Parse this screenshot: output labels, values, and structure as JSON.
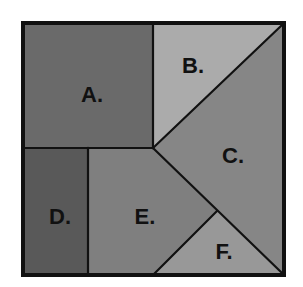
{
  "diagram": {
    "type": "square-dissection-puzzle",
    "outer_square": {
      "x": 23,
      "y": 23,
      "width": 261,
      "height": 252,
      "border_color": "#111111",
      "border_width": 4
    },
    "pieces": [
      {
        "id": "A",
        "label": "A.",
        "shape": "square",
        "fill": "#6a6a6a",
        "points": "25,25 153,25 153,148 25,148",
        "label_pos": {
          "x": 92,
          "y": 96
        }
      },
      {
        "id": "B",
        "label": "B.",
        "shape": "triangle",
        "fill": "#ababab",
        "points": "153,25 282,25 153,148",
        "label_pos": {
          "x": 193,
          "y": 67
        }
      },
      {
        "id": "C",
        "label": "C.",
        "shape": "quadrilateral",
        "fill": "#868686",
        "points": "282,25 282,273 153,148",
        "label_pos": {
          "x": 233,
          "y": 157
        }
      },
      {
        "id": "D",
        "label": "D.",
        "shape": "rectangle",
        "fill": "#595959",
        "points": "25,148 88,148 88,273 25,273",
        "label_pos": {
          "x": 60,
          "y": 218
        }
      },
      {
        "id": "E",
        "label": "E.",
        "shape": "pentagon",
        "fill": "#7f7f7f",
        "points": "88,148 153,148 217,211 155,273 88,273",
        "label_pos": {
          "x": 145,
          "y": 218
        }
      },
      {
        "id": "F",
        "label": "F.",
        "shape": "triangle",
        "fill": "#989898",
        "points": "217,211 282,273 155,273",
        "label_pos": {
          "x": 224,
          "y": 253
        }
      }
    ],
    "divider_lines": [
      {
        "x1": 153,
        "y1": 25,
        "x2": 153,
        "y2": 148
      },
      {
        "x1": 25,
        "y1": 148,
        "x2": 153,
        "y2": 148
      },
      {
        "x1": 153,
        "y1": 148,
        "x2": 282,
        "y2": 25
      },
      {
        "x1": 153,
        "y1": 148,
        "x2": 282,
        "y2": 273
      },
      {
        "x1": 217,
        "y1": 211,
        "x2": 155,
        "y2": 273
      },
      {
        "x1": 88,
        "y1": 148,
        "x2": 88,
        "y2": 273
      }
    ],
    "line_color": "#111111"
  }
}
